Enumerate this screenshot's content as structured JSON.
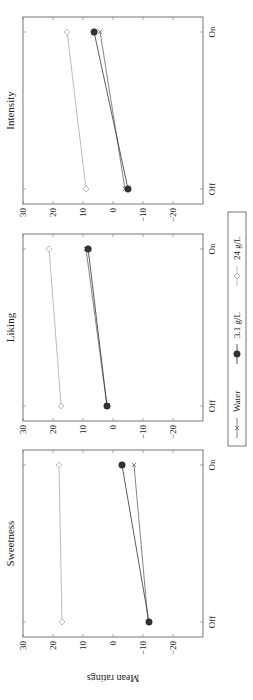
{
  "chart_data": {
    "type": "line",
    "orientation_note": "figure is rotated 90 degrees counter-clockwise in the screenshot",
    "ylabel": "Mean ratings",
    "ylim": [
      -30,
      30
    ],
    "yticks": [
      30,
      20,
      10,
      0,
      -10,
      -20
    ],
    "ytick_labels": [
      "30",
      "20",
      "10",
      "0",
      "−10",
      "−20"
    ],
    "categories": [
      "Off",
      "On"
    ],
    "legend": {
      "placement": "bottom",
      "entries": [
        {
          "name": "Water",
          "marker": "x",
          "color": "#777777"
        },
        {
          "name": "3.1 g/L",
          "marker": "filled-circle",
          "color": "#333333"
        },
        {
          "name": "24 g/L",
          "marker": "diamond",
          "color": "#bbbbbb"
        }
      ]
    },
    "panels": [
      {
        "title": "Sweetness",
        "series": [
          {
            "name": "Water",
            "values": [
              -11.7,
              -7
            ]
          },
          {
            "name": "3.1 g/L",
            "values": [
              -12,
              -3
            ]
          },
          {
            "name": "24 g/L",
            "values": [
              17,
              18
            ]
          }
        ]
      },
      {
        "title": "Liking",
        "series": [
          {
            "name": "Water",
            "values": [
              2,
              9
            ]
          },
          {
            "name": "3.1 g/L",
            "values": [
              2,
              8.3
            ]
          },
          {
            "name": "24 g/L",
            "values": [
              17.3,
              21.3
            ]
          }
        ]
      },
      {
        "title": "Intensity",
        "series": [
          {
            "name": "Water",
            "values": [
              -4,
              4.3
            ]
          },
          {
            "name": "3.1 g/L",
            "values": [
              -5,
              6.3
            ]
          },
          {
            "name": "24 g/L",
            "values": [
              9,
              15.3
            ]
          }
        ]
      }
    ]
  }
}
